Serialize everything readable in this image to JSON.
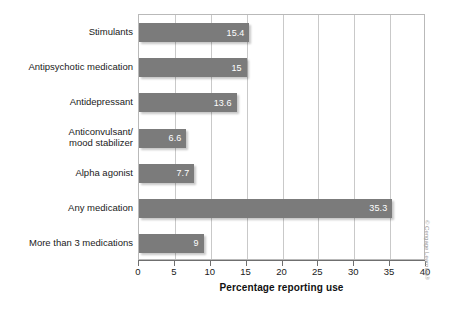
{
  "chart_data": {
    "type": "bar",
    "orientation": "horizontal",
    "title": "",
    "subtitle": "",
    "xlabel": "Percentage reporting use",
    "ylabel": "",
    "xlim": [
      0,
      40
    ],
    "ylim": null,
    "xticks": [
      0,
      5,
      10,
      15,
      20,
      25,
      30,
      35,
      40
    ],
    "xtick_labels": [
      "0",
      "5",
      "10",
      "15",
      "20",
      "25",
      "30",
      "35",
      "40"
    ],
    "grid": "vertical",
    "legend": null,
    "legend_position": "none",
    "bar_color": "#7b7b7b",
    "data_label_color": "#ffffff",
    "categories": [
      "Stimulants",
      "Antipsychotic medication",
      "Antidepressant",
      "Anticonvulsant/\nmood stabilizer",
      "Alpha agonist",
      "Any medication",
      "More than 3 medications"
    ],
    "values": [
      15.4,
      15,
      13.6,
      6.6,
      7.7,
      35.3,
      9
    ],
    "data_labels": [
      "15.4",
      "15",
      "13.6",
      "6.6",
      "7.7",
      "35.3",
      "9"
    ]
  },
  "credit": {
    "text": "© Cengage Learning®"
  }
}
